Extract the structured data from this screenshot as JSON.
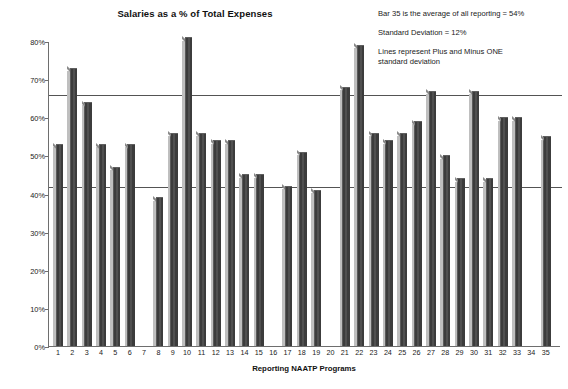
{
  "chart_data": {
    "type": "bar",
    "title": "Salaries as a % of Total Expenses",
    "xlabel": "Reporting NAATP Programs",
    "ylabel": "Percent",
    "ylim": [
      0,
      80
    ],
    "ytick_step": 10,
    "ytick_labels": [
      "0%",
      "10%",
      "20%",
      "30%",
      "40%",
      "50%",
      "60%",
      "70%",
      "80%"
    ],
    "ytick_values": [
      0,
      10,
      20,
      30,
      40,
      50,
      60,
      70,
      80
    ],
    "grid": false,
    "legend": "none",
    "bar_color": "#3c3c3c",
    "categories": [
      "1",
      "2",
      "3",
      "4",
      "5",
      "6",
      "7",
      "8",
      "9",
      "10",
      "11",
      "12",
      "13",
      "14",
      "15",
      "16",
      "17",
      "18",
      "19",
      "20",
      "21",
      "22",
      "23",
      "24",
      "25",
      "26",
      "27",
      "28",
      "29",
      "30",
      "31",
      "32",
      "33",
      "34",
      "35"
    ],
    "values": [
      53,
      73,
      64,
      53,
      47,
      53,
      0,
      39,
      56,
      81,
      56,
      54,
      54,
      45,
      45,
      0,
      42,
      51,
      41,
      0,
      68,
      79,
      56,
      54,
      56,
      59,
      67,
      50,
      44,
      67,
      44,
      60,
      60,
      0,
      55
    ],
    "missing_categories": [
      "7",
      "16",
      "20",
      "34"
    ],
    "reference_lines": [
      {
        "name": "plus-one-standard-deviation",
        "value": 66
      },
      {
        "name": "minus-one-standard-deviation",
        "value": 42
      }
    ],
    "annotations": [
      "Bar 35 is the average of all reporting = 54%",
      "Standard Deviation = 12%",
      "Lines represent Plus and Minus ONE\nstandard deviation"
    ]
  }
}
